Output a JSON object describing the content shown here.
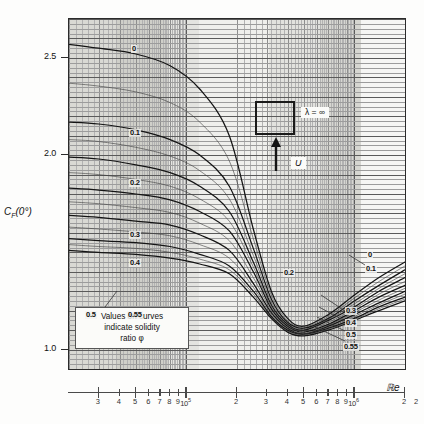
{
  "figure": {
    "y_axis_title": "C",
    "y_axis_sub": "F",
    "y_axis_suffix": "(0°)",
    "x_axis_title": "ℝe",
    "note_line1": "Values on curves",
    "note_line2": "indicate solidity",
    "note_line3": "ratio φ",
    "lambda_label": "λ = ∞",
    "velocity_label": "U"
  },
  "y_ticks": [
    {
      "value": 2.5,
      "label": "2.5"
    },
    {
      "value": 2.0,
      "label": "2.0"
    },
    {
      "value": 1.0,
      "label": "1.0"
    }
  ],
  "x_ticks": [
    {
      "label": "3"
    },
    {
      "label": "4"
    },
    {
      "label": "5"
    },
    {
      "label": "6"
    },
    {
      "label": "7"
    },
    {
      "label": "8"
    },
    {
      "label": "9"
    },
    {
      "label": "10⁵"
    },
    {
      "label": "2"
    },
    {
      "label": "3"
    },
    {
      "label": "4"
    },
    {
      "label": "5"
    },
    {
      "label": "6"
    },
    {
      "label": "7"
    },
    {
      "label": "8"
    },
    {
      "label": "9"
    },
    {
      "label": "10⁶"
    },
    {
      "label": "2"
    }
  ],
  "left_labels": [
    {
      "text": "0"
    },
    {
      "text": "0.1"
    },
    {
      "text": "0.2"
    },
    {
      "text": "0.3"
    },
    {
      "text": "0.4"
    },
    {
      "text": "0.5"
    },
    {
      "text": "0.55"
    }
  ],
  "right_labels": [
    {
      "text": "0"
    },
    {
      "text": "0.1"
    },
    {
      "text": "0.2"
    },
    {
      "text": "0.3"
    },
    {
      "text": "0.4"
    },
    {
      "text": "0.5"
    },
    {
      "text": "0.55"
    }
  ],
  "colors": {
    "frame": "#2b2b2b",
    "curve": "#1b1b1b",
    "grid_major": "#6f6f6f",
    "grid_minor": "#a9a9a9",
    "plot_bg": "#f2f2ef",
    "band_dark": "#d4d4cf",
    "band_light": "#efefec"
  },
  "chart_data": {
    "type": "line",
    "title": "",
    "xlabel": "ℝe",
    "ylabel": "C_F(0°)",
    "xscale": "log",
    "yscale": "linear",
    "xlim": [
      20000,
      2000000
    ],
    "ylim": [
      0.9,
      2.7
    ],
    "grid": true,
    "legend": "none",
    "note": "Values on curves indicate solidity ratio φ",
    "annotations": [
      {
        "text": "λ = ∞",
        "x": 300000,
        "y": 2.22
      },
      {
        "text": "U",
        "x": 310000,
        "y": 1.92
      }
    ],
    "x": [
      20000,
      30000,
      50000,
      80000,
      120000,
      180000,
      250000,
      320000,
      400000,
      500000,
      700000,
      1000000,
      1400000,
      2000000
    ],
    "series": [
      {
        "name": "0",
        "values": [
          2.57,
          2.55,
          2.52,
          2.46,
          2.34,
          2.1,
          1.62,
          1.3,
          1.16,
          1.12,
          1.18,
          1.28,
          1.37,
          1.45
        ]
      },
      {
        "name": "0.1",
        "values": [
          2.17,
          2.16,
          2.13,
          2.08,
          2.0,
          1.84,
          1.52,
          1.26,
          1.14,
          1.11,
          1.16,
          1.25,
          1.33,
          1.41
        ]
      },
      {
        "name": "0.2",
        "values": [
          1.99,
          1.98,
          1.95,
          1.91,
          1.84,
          1.71,
          1.45,
          1.23,
          1.13,
          1.1,
          1.15,
          1.22,
          1.3,
          1.37
        ]
      },
      {
        "name": "0.3",
        "values": [
          1.83,
          1.82,
          1.8,
          1.77,
          1.71,
          1.61,
          1.4,
          1.21,
          1.12,
          1.09,
          1.13,
          1.2,
          1.27,
          1.33
        ]
      },
      {
        "name": "0.4",
        "values": [
          1.69,
          1.68,
          1.66,
          1.64,
          1.59,
          1.51,
          1.34,
          1.19,
          1.11,
          1.08,
          1.12,
          1.18,
          1.24,
          1.3
        ]
      },
      {
        "name": "0.5",
        "values": [
          1.57,
          1.56,
          1.55,
          1.53,
          1.49,
          1.43,
          1.3,
          1.17,
          1.1,
          1.08,
          1.11,
          1.16,
          1.22,
          1.27
        ]
      },
      {
        "name": "0.55",
        "values": [
          1.51,
          1.5,
          1.49,
          1.47,
          1.44,
          1.39,
          1.27,
          1.16,
          1.09,
          1.07,
          1.1,
          1.15,
          1.2,
          1.25
        ]
      }
    ]
  }
}
